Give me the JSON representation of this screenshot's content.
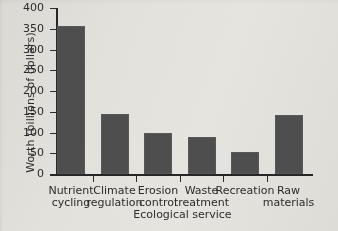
{
  "chart_data": {
    "type": "bar",
    "title": "",
    "xlabel": "Ecological service",
    "ylabel": "Worth (billions of dollars)",
    "categories": [
      "Nutrient cycling",
      "Climate regulation",
      "Erosion control",
      "Waste treatment",
      "Recreation",
      "Raw materials"
    ],
    "category_lines": [
      {
        "line1": "Nutrient",
        "line2": "cycling"
      },
      {
        "line1": "Climate",
        "line2": "regulation"
      },
      {
        "line1": "Erosion",
        "line2": "control"
      },
      {
        "line1": "Waste",
        "line2": "treatment"
      },
      {
        "line1": "Recreation",
        "line2": ""
      },
      {
        "line1": "Raw",
        "line2": "materials"
      }
    ],
    "values": [
      357,
      145,
      99,
      88,
      54,
      142
    ],
    "ylim": [
      0,
      400
    ],
    "yticks": [
      0,
      50,
      100,
      150,
      200,
      250,
      300,
      350,
      400
    ],
    "ytick_labels": [
      "0",
      "50",
      "100",
      "150",
      "200",
      "250",
      "300",
      "350",
      "400"
    ],
    "grid": false,
    "legend": false,
    "bar_color": "#4e4e4e",
    "axis_color": "#262626",
    "background_color": "#e3e1dc"
  }
}
